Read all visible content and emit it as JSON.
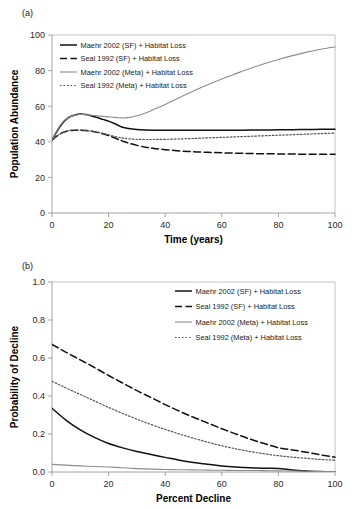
{
  "figure": {
    "panel_a_label": "(a)",
    "panel_b_label": "(b)"
  },
  "legend_labels": {
    "maehr_sf": "Maehr 2002 (SF) + Habitat Loss",
    "seal_sf": "Seal 1992 (SF) + Habitat Loss",
    "maehr_meta": "Maehr 2002 (Meta) + Habitat Loss",
    "seal_meta": "Seal 1992 (Meta) + Habitat Loss"
  },
  "colors": {
    "maehr_sf": "#111111",
    "seal_sf": "#111111",
    "maehr_meta": "#8c8c8c",
    "seal_meta": "#555555",
    "axis": "#9a9a9a",
    "frame": "#b5b5b5"
  },
  "chart_data": [
    {
      "type": "line",
      "panel": "(a)",
      "title": "",
      "xlabel": "Time (years)",
      "ylabel": "Population Abundance",
      "xlim": [
        0,
        100
      ],
      "ylim": [
        0,
        100
      ],
      "xticks": [
        0,
        20,
        40,
        60,
        80,
        100
      ],
      "yticks": [
        0,
        20,
        40,
        60,
        80,
        100
      ],
      "xtick_labels": [
        "0",
        "20",
        "40",
        "60",
        "80",
        "100"
      ],
      "ytick_labels": [
        "0",
        "20",
        "40",
        "60",
        "80",
        "100"
      ],
      "grid": false,
      "legend_position": "upper-left",
      "x": [
        0,
        2,
        4,
        6,
        8,
        10,
        12,
        14,
        16,
        18,
        20,
        22,
        24,
        25,
        27,
        30,
        33,
        36,
        40,
        45,
        50,
        55,
        60,
        65,
        70,
        75,
        80,
        85,
        90,
        95,
        100
      ],
      "series": [
        {
          "name": "Maehr 2002 (SF) + Habitat Loss",
          "style": "solid",
          "color": "#111111",
          "values": [
            41.0,
            46.5,
            51.0,
            53.8,
            55.0,
            55.6,
            55.3,
            54.5,
            53.6,
            52.6,
            51.6,
            50.3,
            48.8,
            48.2,
            47.5,
            46.9,
            46.6,
            46.5,
            46.5,
            46.5,
            46.5,
            46.5,
            46.5,
            46.5,
            46.6,
            46.6,
            46.7,
            46.8,
            46.9,
            47.0,
            47.1
          ]
        },
        {
          "name": "Seal 1992 (SF) + Habitat Loss",
          "style": "dashed",
          "color": "#111111",
          "values": [
            41.0,
            43.5,
            45.3,
            46.2,
            46.5,
            46.5,
            46.3,
            45.9,
            45.3,
            44.5,
            43.5,
            42.3,
            41.0,
            40.4,
            39.3,
            38.0,
            37.0,
            36.3,
            35.6,
            34.9,
            34.4,
            34.1,
            33.8,
            33.6,
            33.4,
            33.3,
            33.2,
            33.1,
            33.0,
            33.0,
            33.0
          ]
        },
        {
          "name": "Maehr 2002 (Meta) + Habitat Loss",
          "style": "solid-thin",
          "color": "#8c8c8c",
          "values": [
            41.0,
            47.0,
            51.5,
            53.8,
            54.8,
            55.3,
            55.2,
            54.9,
            54.6,
            54.3,
            54.0,
            53.7,
            53.5,
            53.4,
            53.6,
            54.6,
            56.2,
            58.2,
            61.0,
            64.8,
            68.5,
            72.0,
            75.3,
            78.3,
            81.2,
            83.8,
            86.2,
            88.4,
            90.4,
            92.0,
            93.3
          ]
        },
        {
          "name": "Seal 1992 (Meta) + Habitat Loss",
          "style": "dotted",
          "color": "#555555",
          "values": [
            41.0,
            43.6,
            45.4,
            46.3,
            46.6,
            46.6,
            46.4,
            46.0,
            45.4,
            44.7,
            43.9,
            43.1,
            42.4,
            42.1,
            41.7,
            41.4,
            41.3,
            41.3,
            41.4,
            41.6,
            41.9,
            42.2,
            42.5,
            42.8,
            43.1,
            43.4,
            43.7,
            44.0,
            44.3,
            44.6,
            44.9
          ]
        }
      ]
    },
    {
      "type": "line",
      "panel": "(b)",
      "title": "",
      "xlabel": "Percent Decline",
      "ylabel": "Probability of Decline",
      "xlim": [
        0,
        100
      ],
      "ylim": [
        0.0,
        1.0
      ],
      "xticks": [
        0,
        20,
        40,
        60,
        80,
        100
      ],
      "yticks": [
        0.0,
        0.2,
        0.4,
        0.6,
        0.8,
        1.0
      ],
      "xtick_labels": [
        "0",
        "20",
        "40",
        "60",
        "80",
        "100"
      ],
      "ytick_labels": [
        "0.0",
        "0.2",
        "0.4",
        "0.6",
        "0.8",
        "1.0"
      ],
      "grid": false,
      "legend_position": "upper-right",
      "x": [
        0,
        5,
        10,
        15,
        20,
        25,
        30,
        35,
        40,
        45,
        50,
        55,
        60,
        65,
        70,
        75,
        80,
        85,
        90,
        95,
        100
      ],
      "series": [
        {
          "name": "Maehr 2002 (SF) + Habitat Loss",
          "style": "solid",
          "color": "#111111",
          "values": [
            0.335,
            0.272,
            0.222,
            0.182,
            0.15,
            0.127,
            0.108,
            0.092,
            0.077,
            0.062,
            0.05,
            0.041,
            0.032,
            0.026,
            0.022,
            0.02,
            0.019,
            0.01,
            0.005,
            0.002,
            0.0
          ]
        },
        {
          "name": "Seal 1992 (SF) + Habitat Loss",
          "style": "dashed",
          "color": "#111111",
          "values": [
            0.672,
            0.63,
            0.59,
            0.55,
            0.508,
            0.468,
            0.428,
            0.392,
            0.355,
            0.32,
            0.288,
            0.258,
            0.228,
            0.2,
            0.173,
            0.15,
            0.128,
            0.116,
            0.104,
            0.09,
            0.078
          ]
        },
        {
          "name": "Maehr 2002 (Meta) + Habitat Loss",
          "style": "solid-thin",
          "color": "#8c8c8c",
          "values": [
            0.04,
            0.036,
            0.032,
            0.029,
            0.026,
            0.022,
            0.018,
            0.015,
            0.013,
            0.012,
            0.011,
            0.01,
            0.009,
            0.008,
            0.008,
            0.007,
            0.006,
            0.005,
            0.004,
            0.003,
            0.002
          ]
        },
        {
          "name": "Seal 1992 (Meta) + Habitat Loss",
          "style": "dotted",
          "color": "#555555",
          "values": [
            0.478,
            0.442,
            0.408,
            0.374,
            0.34,
            0.308,
            0.278,
            0.25,
            0.224,
            0.2,
            0.178,
            0.157,
            0.138,
            0.122,
            0.108,
            0.096,
            0.086,
            0.078,
            0.072,
            0.066,
            0.062
          ]
        }
      ]
    }
  ]
}
